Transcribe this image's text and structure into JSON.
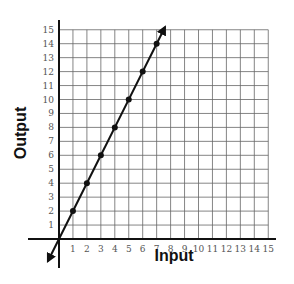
{
  "chart_data": {
    "type": "line",
    "title": "",
    "xlabel": "Input",
    "ylabel": "Output",
    "xlim": [
      0,
      15
    ],
    "ylim": [
      0,
      15
    ],
    "grid": true,
    "x_ticks": [
      "1",
      "2",
      "3",
      "4",
      "5",
      "6",
      "7",
      "8",
      "9",
      "10",
      "11",
      "12",
      "13",
      "14",
      "15"
    ],
    "y_ticks": [
      "1",
      "2",
      "3",
      "4",
      "5",
      "6",
      "7",
      "8",
      "9",
      "10",
      "11",
      "12",
      "13",
      "14",
      "15"
    ],
    "series": [
      {
        "name": "Output = 2 × Input",
        "points": [
          {
            "x": 1,
            "y": 2
          },
          {
            "x": 2,
            "y": 4
          },
          {
            "x": 3,
            "y": 6
          },
          {
            "x": 4,
            "y": 8
          },
          {
            "x": 5,
            "y": 10
          },
          {
            "x": 6,
            "y": 12
          },
          {
            "x": 7,
            "y": 14
          }
        ],
        "line_extent": {
          "from": {
            "x": -0.8,
            "y": -1.6
          },
          "to": {
            "x": 7.6,
            "y": 15.2
          }
        },
        "arrows": "both-ends"
      }
    ]
  }
}
